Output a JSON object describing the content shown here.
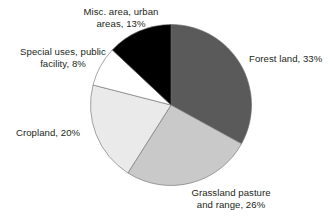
{
  "chart_data": {
    "type": "pie",
    "title": "",
    "subtitle": "",
    "xlabel": "",
    "ylabel": "",
    "legend_position": "none",
    "grid": false,
    "units": "percent",
    "start_angle_deg": 0,
    "direction": "clockwise",
    "categories": [
      "Forest land",
      "Grassland pasture and range",
      "Cropland",
      "Special uses, public facility",
      "Misc. area, urban areas"
    ],
    "values": [
      33,
      26,
      20,
      8,
      13
    ],
    "colors": [
      "#5a5a5a",
      "#c9c9c9",
      "#eaeaea",
      "#ffffff",
      "#000000"
    ],
    "slices": [
      {
        "name": "Forest land",
        "value": 33,
        "label": "Forest land, 33%",
        "color": "#5a5a5a",
        "start_deg": 0,
        "end_deg": 118.8
      },
      {
        "name": "Grassland pasture and range",
        "value": 26,
        "label_line1": "Grassland pasture",
        "label_line2": "and range, 26%",
        "color": "#c9c9c9",
        "start_deg": 118.8,
        "end_deg": 212.4
      },
      {
        "name": "Cropland",
        "value": 20,
        "label": "Cropland, 20%",
        "color": "#eaeaea",
        "start_deg": 212.4,
        "end_deg": 284.4
      },
      {
        "name": "Special uses, public facility",
        "value": 8,
        "label_line1": "Special uses, public",
        "label_line2": "facility, 8%",
        "color": "#ffffff",
        "start_deg": 284.4,
        "end_deg": 313.2
      },
      {
        "name": "Misc. area, urban areas",
        "value": 13,
        "label_line1": "Misc. area, urban",
        "label_line2": "areas, 13%",
        "color": "#000000",
        "start_deg": 313.2,
        "end_deg": 360
      }
    ]
  },
  "labels": {
    "misc_line1": "Misc. area, urban",
    "misc_line2": "areas, 13%",
    "special_line1": "Special uses, public",
    "special_line2": "facility, 8%",
    "forest": "Forest land, 33%",
    "cropland": "Cropland, 20%",
    "grassland_line1": "Grassland pasture",
    "grassland_line2": "and range, 26%"
  }
}
